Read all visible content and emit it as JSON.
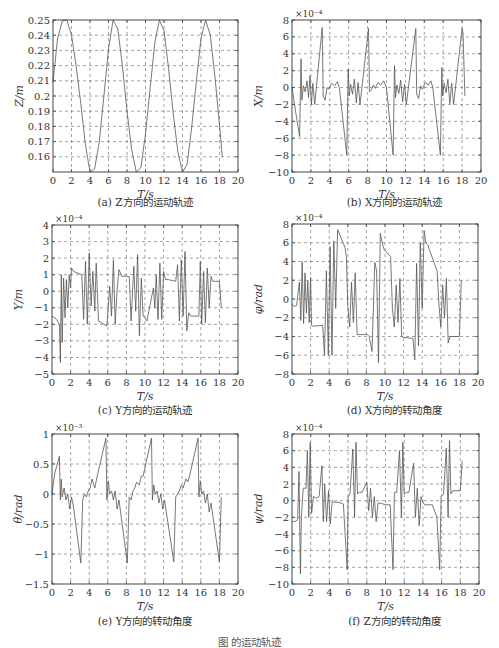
{
  "figure": {
    "caption": "图            的运动轨迹"
  },
  "panels": [
    {
      "id": "a",
      "caption": "(a) Z方向的运动轨迹"
    },
    {
      "id": "b",
      "caption": "(b) X方向的运动轨迹"
    },
    {
      "id": "c",
      "caption": "(c) Y方向的运动轨迹"
    },
    {
      "id": "d",
      "caption": "(d) X方向的转动角度"
    },
    {
      "id": "e",
      "caption": "(e) Y方向的转动角度"
    },
    {
      "id": "f",
      "caption": "(f) Z方向的转动角度"
    }
  ],
  "chart_data": [
    {
      "id": "a",
      "type": "line",
      "title": "(a) Z方向的运动轨迹",
      "xlabel": "T/s",
      "ylabel": "Z/m",
      "multiplier": "",
      "xlim": [
        0,
        20
      ],
      "ylim": [
        0.15,
        0.25
      ],
      "xticks": [
        0,
        2,
        4,
        6,
        8,
        10,
        12,
        14,
        16,
        18,
        20
      ],
      "yticks": [
        0.16,
        0.17,
        0.18,
        0.19,
        0.2,
        0.21,
        0.22,
        0.23,
        0.24,
        0.25
      ],
      "ytick_labels": [
        "0.16",
        "0.17",
        "0.18",
        "0.19",
        "0.2",
        "0.21",
        "0.22",
        "0.23",
        "0.24",
        "0.25"
      ],
      "grid": true,
      "x": [
        0,
        0.5,
        1.0,
        1.5,
        2.0,
        2.5,
        3.0,
        3.5,
        4.0,
        4.5,
        5.0,
        5.5,
        6.0,
        6.5,
        7.0,
        7.5,
        8.0,
        8.5,
        9.0,
        9.5,
        10.0,
        10.5,
        11.0,
        11.5,
        12.0,
        12.5,
        13.0,
        13.5,
        14.0,
        14.5,
        15.0,
        15.5,
        16.0,
        16.5,
        17.0,
        17.5,
        18.0,
        18.3
      ],
      "y": [
        0.209,
        0.238,
        0.2495,
        0.25,
        0.24,
        0.22,
        0.195,
        0.168,
        0.15,
        0.152,
        0.17,
        0.2,
        0.231,
        0.25,
        0.244,
        0.22,
        0.19,
        0.165,
        0.15,
        0.153,
        0.175,
        0.205,
        0.235,
        0.25,
        0.243,
        0.218,
        0.188,
        0.163,
        0.15,
        0.155,
        0.18,
        0.21,
        0.238,
        0.25,
        0.24,
        0.213,
        0.181,
        0.16
      ]
    },
    {
      "id": "b",
      "type": "line",
      "title": "(b) X方向的运动轨迹",
      "xlabel": "T/s",
      "ylabel": "X/m",
      "multiplier": "×10⁻⁴",
      "xlim": [
        0,
        20
      ],
      "ylim": [
        -10,
        8
      ],
      "xticks": [
        0,
        2,
        4,
        6,
        8,
        10,
        12,
        14,
        16,
        18,
        20
      ],
      "yticks": [
        -10,
        -8,
        -6,
        -4,
        -2,
        0,
        2,
        4,
        6,
        8
      ],
      "ytick_labels": [
        "−10",
        "−8",
        "−6",
        "−4",
        "−2",
        "0",
        "2",
        "4",
        "6",
        "8"
      ],
      "grid": true,
      "x": [
        0,
        0.4,
        0.8,
        0.95,
        1.05,
        1.2,
        1.4,
        1.6,
        1.75,
        1.9,
        2.05,
        2.2,
        2.4,
        3.2,
        3.3,
        3.5,
        3.7,
        3.9,
        4.2,
        4.5,
        4.8,
        5.0,
        5.8,
        5.95,
        6.05,
        6.2,
        6.4,
        6.6,
        6.8,
        7.0,
        7.2,
        8.1,
        8.2,
        8.4,
        8.6,
        8.8,
        9.1,
        9.4,
        9.7,
        10.0,
        10.7,
        10.85,
        10.95,
        11.1,
        11.3,
        11.5,
        11.7,
        11.9,
        12.1,
        13.1,
        13.2,
        13.4,
        13.6,
        13.8,
        14.1,
        14.4,
        14.7,
        14.9,
        15.7,
        15.85,
        15.95,
        16.1,
        16.3,
        16.5,
        16.7,
        16.9,
        17.1,
        18.0,
        18.1,
        18.3
      ],
      "y": [
        0,
        -3,
        -5.8,
        3.4,
        -1.5,
        0.2,
        -0.5,
        0.8,
        -1.2,
        1.4,
        -2,
        0.5,
        -2,
        7.1,
        -1,
        -1.5,
        0,
        -0.2,
        0.5,
        0.2,
        0.7,
        0,
        -8,
        2.2,
        -1,
        0.4,
        -0.8,
        1,
        -1.8,
        0.6,
        -2,
        7,
        -0.5,
        -0.3,
        0.3,
        -0.1,
        0.6,
        0.3,
        0.8,
        0,
        -8,
        2.6,
        -1.2,
        0.3,
        -0.7,
        0.9,
        -1.7,
        0.4,
        -2,
        7,
        -0.8,
        -1.3,
        0.2,
        -0.2,
        0.6,
        0.3,
        0.8,
        0,
        -8,
        2.4,
        -1,
        0.5,
        -0.6,
        1,
        -1.9,
        0.5,
        -2,
        7,
        6.5,
        -1
      ]
    },
    {
      "id": "c",
      "type": "line",
      "title": "(c) Y方向的运动轨迹",
      "xlabel": "T/s",
      "ylabel": "Y/m",
      "multiplier": "×10⁻⁴",
      "xlim": [
        0,
        20
      ],
      "ylim": [
        -5,
        4
      ],
      "xticks": [
        0,
        2,
        4,
        6,
        8,
        10,
        12,
        14,
        16,
        18,
        20
      ],
      "yticks": [
        -5,
        -4,
        -3,
        -2,
        -1,
        0,
        1,
        2,
        3,
        4
      ],
      "ytick_labels": [
        "−5",
        "−4",
        "−3",
        "−2",
        "−1",
        "0",
        "1",
        "2",
        "3",
        "4"
      ],
      "grid": true,
      "x": [
        0,
        0.5,
        0.8,
        0.9,
        1.0,
        1.1,
        1.25,
        1.4,
        1.55,
        1.7,
        1.85,
        2.0,
        2.1,
        2.3,
        3.2,
        3.4,
        3.6,
        3.8,
        4.0,
        4.2,
        4.4,
        4.6,
        4.75,
        5.0,
        5.9,
        6.05,
        6.2,
        6.4,
        6.6,
        6.8,
        7.0,
        7.2,
        7.5,
        8.3,
        8.5,
        8.8,
        9.0,
        9.2,
        9.4,
        9.6,
        9.8,
        10.0,
        10.2,
        10.9,
        11.05,
        11.2,
        11.4,
        11.6,
        11.8,
        12.0,
        12.2,
        12.5,
        13.3,
        13.5,
        13.7,
        13.9,
        14.1,
        14.3,
        14.5,
        14.7,
        14.9,
        15.8,
        15.95,
        16.1,
        16.3,
        16.5,
        16.7,
        16.9,
        17.1,
        17.3,
        18.0,
        18.2
      ],
      "y": [
        -1.5,
        -1.7,
        -2,
        -4.3,
        1,
        -3.1,
        0.8,
        -1.6,
        0.7,
        -1,
        1,
        0.2,
        1.4,
        1.2,
        1,
        -1.7,
        1.8,
        -2,
        2.3,
        -0.9,
        1.2,
        -1.2,
        1.7,
        -1.8,
        -2.1,
        -0.9,
        0.3,
        -1.5,
        1.9,
        -2,
        0.1,
        1.3,
        0.9,
        0.9,
        -1.8,
        1.5,
        -1.2,
        2.2,
        -2.7,
        0.8,
        -1.5,
        -1.6,
        -1.8,
        0.2,
        -1,
        1,
        -1.7,
        1.7,
        -1.7,
        1.2,
        0.7,
        0.7,
        0.6,
        1.6,
        -1.8,
        1.9,
        -1.5,
        2.4,
        -2.4,
        -1.3,
        -1.5,
        -1.5,
        1.8,
        -2,
        1.2,
        -1.9,
        1.4,
        -1,
        0.9,
        0.6,
        0.6,
        -1
      ]
    },
    {
      "id": "d",
      "type": "line",
      "title": "(d) X方向的转动角度",
      "xlabel": "T/s",
      "ylabel": "φ/rad",
      "multiplier": "×10⁻⁴",
      "xlim": [
        0,
        20
      ],
      "ylim": [
        -8,
        8
      ],
      "xticks": [
        0,
        2,
        4,
        6,
        8,
        10,
        12,
        14,
        16,
        18,
        20
      ],
      "yticks": [
        -8,
        -6,
        -4,
        -2,
        0,
        2,
        4,
        6,
        8
      ],
      "ytick_labels": [
        "−8",
        "−6",
        "−4",
        "−2",
        "0",
        "2",
        "4",
        "6",
        "8"
      ],
      "grid": true,
      "x": [
        0,
        0.2,
        0.5,
        0.8,
        0.95,
        1.1,
        1.25,
        1.4,
        1.55,
        1.7,
        1.85,
        2.0,
        2.1,
        2.3,
        3.3,
        3.5,
        3.7,
        3.9,
        4.1,
        4.3,
        4.5,
        4.7,
        4.9,
        5.7,
        5.85,
        6.0,
        6.2,
        6.4,
        6.6,
        6.8,
        7.0,
        8.1,
        8.3,
        8.6,
        8.9,
        9.1,
        9.3,
        9.5,
        9.7,
        9.9,
        10.6,
        10.8,
        11.0,
        11.2,
        11.4,
        11.6,
        11.8,
        12.0,
        13.0,
        13.2,
        13.4,
        13.6,
        13.8,
        14.0,
        14.2,
        14.4,
        14.6,
        14.8,
        15.6,
        15.8,
        16.0,
        16.2,
        16.4,
        16.6,
        16.8,
        17.0,
        18.0,
        18.2
      ],
      "y": [
        -0.5,
        -0.8,
        -0.7,
        1.8,
        -2.3,
        4,
        -2.6,
        2.8,
        -1.5,
        2,
        -2.5,
        2.3,
        -2.8,
        -2.9,
        -2.8,
        -6,
        3,
        -6,
        5.6,
        -6,
        6.2,
        -1,
        7.4,
        5.5,
        4.5,
        -0.8,
        -3,
        1.8,
        -2.5,
        2.8,
        -3.8,
        -3.8,
        -4,
        -5.6,
        3.9,
        3,
        -6.8,
        7,
        6,
        5.3,
        4.5,
        -1,
        -3,
        1.5,
        -2.5,
        2.2,
        -4,
        -4.1,
        -4.2,
        -6.5,
        3.8,
        -5,
        6,
        -1,
        7.3,
        6,
        5.8,
        5.2,
        3,
        -0.5,
        -3,
        1.5,
        -2,
        2.2,
        -4.7,
        -4,
        -4,
        2
      ]
    },
    {
      "id": "e",
      "type": "line",
      "title": "(e) Y方向的转动角度",
      "xlabel": "T/s",
      "ylabel": "θ/rad",
      "multiplier": "×10⁻³",
      "xlim": [
        0,
        20
      ],
      "ylim": [
        -1.5,
        1
      ],
      "xticks": [
        0,
        2,
        4,
        6,
        8,
        10,
        12,
        14,
        16,
        18,
        20
      ],
      "yticks": [
        -1.5,
        -1,
        -0.5,
        0,
        0.5,
        1
      ],
      "ytick_labels": [
        "−1.5",
        "−1",
        "−0.5",
        "0",
        "0.5",
        "1"
      ],
      "grid": true,
      "x": [
        0,
        0.3,
        0.8,
        0.9,
        1.0,
        1.1,
        1.3,
        1.5,
        1.7,
        1.9,
        2.1,
        2.3,
        3.1,
        3.3,
        3.5,
        3.7,
        3.9,
        4.1,
        4.3,
        4.6,
        4.8,
        5.8,
        5.9,
        6.05,
        6.2,
        6.4,
        6.6,
        6.8,
        7.0,
        7.2,
        8.1,
        8.3,
        8.5,
        8.7,
        8.9,
        9.1,
        9.4,
        9.6,
        9.8,
        10.7,
        10.8,
        10.95,
        11.1,
        11.3,
        11.5,
        11.7,
        11.9,
        12.1,
        13.1,
        13.3,
        13.5,
        13.7,
        13.9,
        14.1,
        14.4,
        14.6,
        14.8,
        15.7,
        15.8,
        15.95,
        16.1,
        16.3,
        16.5,
        16.7,
        16.9,
        17.1,
        18.0,
        18.2
      ],
      "y": [
        0,
        0.35,
        0.63,
        -0.1,
        0.25,
        -0.05,
        0.1,
        -0.1,
        0,
        -0.25,
        -0.05,
        -0.2,
        -1.15,
        -0.1,
        0,
        -0.05,
        0.05,
        0.1,
        0.25,
        0.1,
        0.25,
        0.93,
        -0.1,
        0.22,
        0,
        0.05,
        -0.1,
        0.05,
        -0.25,
        -0.1,
        -1.15,
        -0.05,
        -0.1,
        0.05,
        0.1,
        0.2,
        0.15,
        0.3,
        0.3,
        0.93,
        -0.1,
        0.15,
        0,
        0.05,
        -0.15,
        0,
        -0.25,
        -0.1,
        -1.13,
        -0.05,
        0,
        0.05,
        0.15,
        0.1,
        0.25,
        0.2,
        0.3,
        0.93,
        -0.05,
        0.22,
        0,
        0.05,
        -0.15,
        0,
        -0.3,
        -0.15,
        -1.13,
        -0.05
      ]
    },
    {
      "id": "f",
      "type": "line",
      "title": "(f) Z方向的转动角度",
      "xlabel": "T/s",
      "ylabel": "ψ/rad",
      "multiplier": "×10⁻⁴",
      "xlim": [
        0,
        20
      ],
      "ylim": [
        -10,
        8
      ],
      "xticks": [
        0,
        2,
        4,
        6,
        8,
        10,
        12,
        14,
        16,
        18,
        20
      ],
      "yticks": [
        -10,
        -8,
        -6,
        -4,
        -2,
        0,
        2,
        4,
        6,
        8
      ],
      "ytick_labels": [
        "−10",
        "−8",
        "−6",
        "−4",
        "−2",
        "0",
        "2",
        "4",
        "6",
        "8"
      ],
      "grid": true,
      "x": [
        0,
        0.3,
        0.6,
        0.75,
        0.9,
        1.0,
        1.2,
        1.5,
        1.65,
        1.8,
        1.95,
        2.1,
        2.3,
        2.6,
        2.9,
        3.2,
        3.35,
        3.5,
        3.7,
        3.9,
        4.1,
        4.3,
        4.5,
        5.0,
        5.5,
        5.9,
        6.0,
        6.2,
        6.5,
        6.7,
        6.85,
        7.0,
        7.2,
        7.5,
        8.0,
        8.2,
        8.4,
        8.6,
        8.8,
        9.0,
        9.2,
        9.5,
        10.0,
        10.5,
        10.8,
        10.95,
        11.2,
        11.5,
        11.7,
        11.85,
        12.0,
        12.2,
        12.5,
        13.0,
        13.2,
        13.4,
        13.6,
        13.8,
        14.0,
        14.2,
        14.5,
        15.0,
        15.5,
        15.8,
        15.95,
        16.2,
        16.5,
        16.7,
        16.85,
        17.0,
        17.2,
        17.5,
        18.0,
        18.2
      ],
      "y": [
        -2.5,
        -2.5,
        -2.3,
        3.5,
        -8.8,
        -2,
        1.5,
        1.5,
        6,
        -2,
        7,
        -1.5,
        0.5,
        0.3,
        0.5,
        4.2,
        -2.5,
        2,
        -2.5,
        1.2,
        -2.8,
        0,
        -0.2,
        -0.2,
        -0.4,
        -8.3,
        0.5,
        0.8,
        6.2,
        -2,
        7,
        0.8,
        1,
        1,
        2.2,
        -1.2,
        1.5,
        -2,
        0.5,
        -2.5,
        -0.3,
        -0.3,
        -0.5,
        -0.5,
        -8.3,
        1,
        1,
        6,
        -2,
        7,
        0.8,
        1,
        1,
        4.5,
        -2,
        1.5,
        -3,
        0.5,
        -0.2,
        -0.5,
        -0.5,
        -0.5,
        -2,
        -8.3,
        0.5,
        0.8,
        6.3,
        -2,
        7.2,
        0.8,
        1.2,
        1.2,
        1.2,
        4.8
      ]
    }
  ]
}
